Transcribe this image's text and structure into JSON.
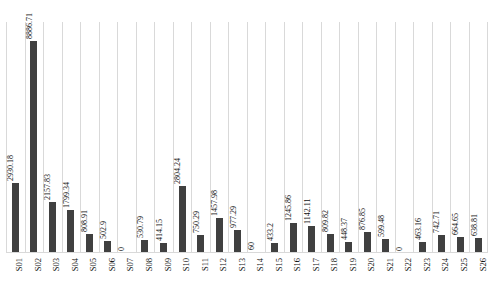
{
  "chart_data": {
    "type": "bar",
    "title": "",
    "subtitle": "",
    "xlabel": "",
    "ylabel": "",
    "grid": "vertical-category-gridlines",
    "legend": "none",
    "ylim": [
      0,
      9700
    ],
    "categories": [
      "S01",
      "S02",
      "S03",
      "S04",
      "S05",
      "S06",
      "S07",
      "S08",
      "S09",
      "S10",
      "S11",
      "S12",
      "S13",
      "S14",
      "S15",
      "S16",
      "S17",
      "S18",
      "S19",
      "S20",
      "S21",
      "S22",
      "S23",
      "S24",
      "S25",
      "S26"
    ],
    "values": [
      2930.18,
      8886.71,
      2157.83,
      1799.34,
      808.91,
      502.9,
      0,
      530.79,
      414.15,
      2804.24,
      750.29,
      1457.98,
      977.29,
      60,
      433.2,
      1245.86,
      1142.11,
      809.82,
      448.37,
      876.85,
      599.48,
      0,
      463.16,
      742.71,
      664.65,
      638.81
    ],
    "value_labels": [
      "2930.18",
      "8886.71",
      "2157.83",
      "1799.34",
      "808.91",
      "502.9",
      "0",
      "530.79",
      "414.15",
      "2804.24",
      "750.29",
      "1457.98",
      "977.29",
      "60",
      "433.2",
      "1245.86",
      "1142.11",
      "809.82",
      "448.37",
      "876.85",
      "599.48",
      "0",
      "463.16",
      "742.71",
      "664.65",
      "638.81"
    ],
    "colors": {
      "bar": "#404040",
      "gridline": "#d9d9d9",
      "text": "#111111",
      "background": "#ffffff"
    }
  }
}
